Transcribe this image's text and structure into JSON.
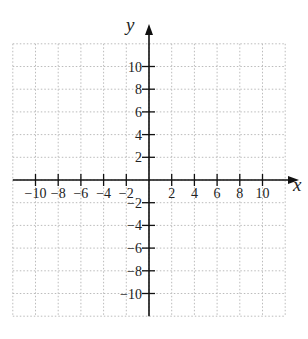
{
  "figure": {
    "type": "coordinate-plane",
    "x_axis": {
      "label": "x",
      "range": [
        -12,
        12
      ],
      "ticks": [
        -10,
        -8,
        -6,
        -4,
        -2,
        2,
        4,
        6,
        8,
        10
      ],
      "tick_labels": [
        "−10",
        "−8",
        "−6",
        "−4",
        "−2",
        "2",
        "4",
        "6",
        "8",
        "10"
      ]
    },
    "y_axis": {
      "label": "y",
      "range": [
        -12,
        12
      ],
      "ticks": [
        10,
        8,
        6,
        4,
        2,
        -2,
        -4,
        -6,
        -8,
        -10
      ],
      "tick_labels": [
        "10",
        "8",
        "6",
        "4",
        "2",
        "−2",
        "−4",
        "−6",
        "−8",
        "−10"
      ]
    },
    "grid": {
      "style": "dotted",
      "spacing": 2,
      "color": "#bbbbbb"
    },
    "axis_color": "#111111"
  }
}
